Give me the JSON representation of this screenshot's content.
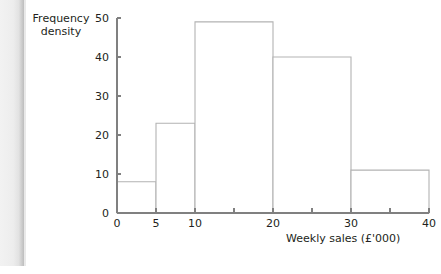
{
  "chart_data": {
    "type": "bar",
    "subtype": "histogram",
    "title": "",
    "xlabel": "Weekly sales (£'000)",
    "ylabel": "Frequency density",
    "ylabel_lines": [
      "Frequency",
      "density"
    ],
    "xlim": [
      0,
      40
    ],
    "ylim": [
      0,
      50
    ],
    "grid": false,
    "legend": null,
    "x_tick_labels": [
      "0",
      "5",
      "10",
      "20",
      "30",
      "40"
    ],
    "x_tick_values": [
      0,
      5,
      10,
      20,
      30,
      40
    ],
    "x_minor_tick_values": [
      15,
      25,
      35
    ],
    "y_tick_labels": [
      "0",
      "10",
      "20",
      "30",
      "40",
      "50"
    ],
    "y_tick_values": [
      0,
      10,
      20,
      30,
      40,
      50
    ],
    "bins": [
      {
        "start": 0,
        "end": 5,
        "label": "0–5",
        "value": 8
      },
      {
        "start": 5,
        "end": 10,
        "label": "5–10",
        "value": 23
      },
      {
        "start": 10,
        "end": 20,
        "label": "10–20",
        "value": 49
      },
      {
        "start": 20,
        "end": 30,
        "label": "20–30",
        "value": 40
      },
      {
        "start": 30,
        "end": 40,
        "label": "30–40",
        "value": 11
      }
    ],
    "categories": [
      "0–5",
      "5–10",
      "10–20",
      "20–30",
      "30–40"
    ],
    "values": [
      8,
      23,
      49,
      40,
      11
    ],
    "colors": {
      "bar_fill": "#ffffff",
      "bar_stroke": "#b3b3b3",
      "axis": "#808080",
      "text": "#231f20",
      "background": "#ffffff"
    }
  }
}
